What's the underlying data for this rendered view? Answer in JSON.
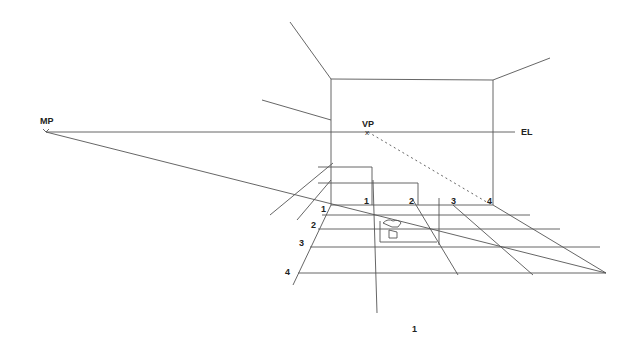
{
  "diagram": {
    "type": "one-point perspective room construction",
    "labels": {
      "mp": "MP",
      "vp": "VP",
      "el": "EL",
      "vp_mark": "x",
      "top_measures": [
        "1",
        "2",
        "3",
        "4"
      ],
      "side_measures": [
        "1",
        "2",
        "3",
        "4"
      ],
      "figure_number": "1"
    },
    "colors": {
      "line": "#555555",
      "text": "#222222",
      "background": "#ffffff"
    }
  }
}
